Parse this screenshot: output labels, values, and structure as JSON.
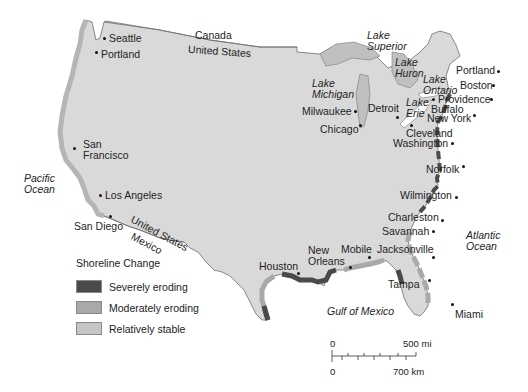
{
  "map": {
    "title": "Shoreline Change",
    "colors": {
      "land": "#d9d9d9",
      "water_white": "#ffffff",
      "lakes": "#c0c0c0",
      "severely_eroding": "#4a4a4a",
      "moderately_eroding": "#a9a9a9",
      "relatively_stable": "#c6c6c6",
      "border": "#6f6f6f"
    },
    "regions": {
      "canada": "Canada",
      "united_states_north": "United States",
      "united_states_south": "United States",
      "mexico": "Mexico"
    },
    "water_bodies": {
      "pacific": [
        "Pacific",
        "Ocean"
      ],
      "atlantic": [
        "Atlantic",
        "Ocean"
      ],
      "gulf": "Gulf of Mexico",
      "lake_superior": [
        "Lake",
        "Superior"
      ],
      "lake_michigan": [
        "Lake",
        "Michigan"
      ],
      "lake_huron": [
        "Lake",
        "Huron"
      ],
      "lake_ontario": [
        "Lake",
        "Ontario"
      ],
      "lake_erie": [
        "Lake",
        "Erie"
      ]
    },
    "cities": [
      {
        "name": "Seattle"
      },
      {
        "name": "Portland"
      },
      {
        "name": "San Francisco",
        "lines": [
          "San",
          "Francisco"
        ]
      },
      {
        "name": "Los Angeles"
      },
      {
        "name": "San Diego"
      },
      {
        "name": "Houston"
      },
      {
        "name": "New Orleans",
        "lines": [
          "New",
          "Orleans"
        ]
      },
      {
        "name": "Mobile"
      },
      {
        "name": "Jacksonville"
      },
      {
        "name": "Tampa"
      },
      {
        "name": "Miami"
      },
      {
        "name": "Savannah"
      },
      {
        "name": "Charleston"
      },
      {
        "name": "Wilmington"
      },
      {
        "name": "Norfolk"
      },
      {
        "name": "Washington"
      },
      {
        "name": "Cleveland"
      },
      {
        "name": "New York"
      },
      {
        "name": "Buffalo"
      },
      {
        "name": "Providence"
      },
      {
        "name": "Boston"
      },
      {
        "name": "Portland"
      },
      {
        "name": "Detroit"
      },
      {
        "name": "Milwaukee"
      },
      {
        "name": "Chicago"
      }
    ]
  },
  "legend": {
    "title": "Shoreline Change",
    "items": [
      {
        "label": "Severely eroding",
        "color": "#4a4a4a"
      },
      {
        "label": "Moderately eroding",
        "color": "#a9a9a9"
      },
      {
        "label": "Relatively stable",
        "color": "#c6c6c6"
      }
    ]
  },
  "scale_bar": {
    "top_left": "0",
    "top_right": "500 mi",
    "bottom_left": "0",
    "bottom_right": "700 km"
  }
}
